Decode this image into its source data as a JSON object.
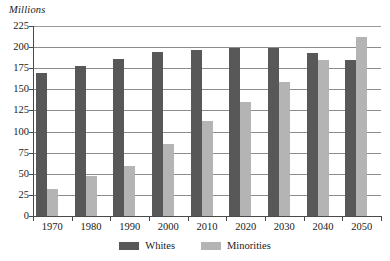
{
  "chart_data": {
    "type": "bar",
    "title": "",
    "subtitle": "",
    "xlabel": "",
    "ylabel": "Millions",
    "categories": [
      "1970",
      "1980",
      "1990",
      "2000",
      "2010",
      "2020",
      "2030",
      "2040",
      "2050"
    ],
    "series": [
      {
        "name": "Whites",
        "color": "#585858",
        "values": [
          169,
          178,
          186,
          194,
          197,
          199,
          199,
          193,
          185
        ]
      },
      {
        "name": "Minorities",
        "color": "#b4b4b4",
        "values": [
          32,
          47,
          59,
          85,
          112,
          135,
          159,
          185,
          212
        ]
      }
    ],
    "ylim": [
      0,
      225
    ],
    "ytick_labels": [
      "225",
      "200",
      "175",
      "150",
      "125",
      "100",
      "75",
      "50",
      "25",
      "0"
    ],
    "ytick_values": [
      225,
      200,
      175,
      150,
      125,
      100,
      75,
      50,
      25,
      0
    ],
    "grid": true,
    "grid_axis": "y",
    "legend_position": "bottom-center",
    "annotations": []
  },
  "legend": {
    "items": [
      {
        "label": "Whites",
        "swatch": "swatch-whites"
      },
      {
        "label": "Minorities",
        "swatch": "swatch-minorities"
      }
    ]
  }
}
